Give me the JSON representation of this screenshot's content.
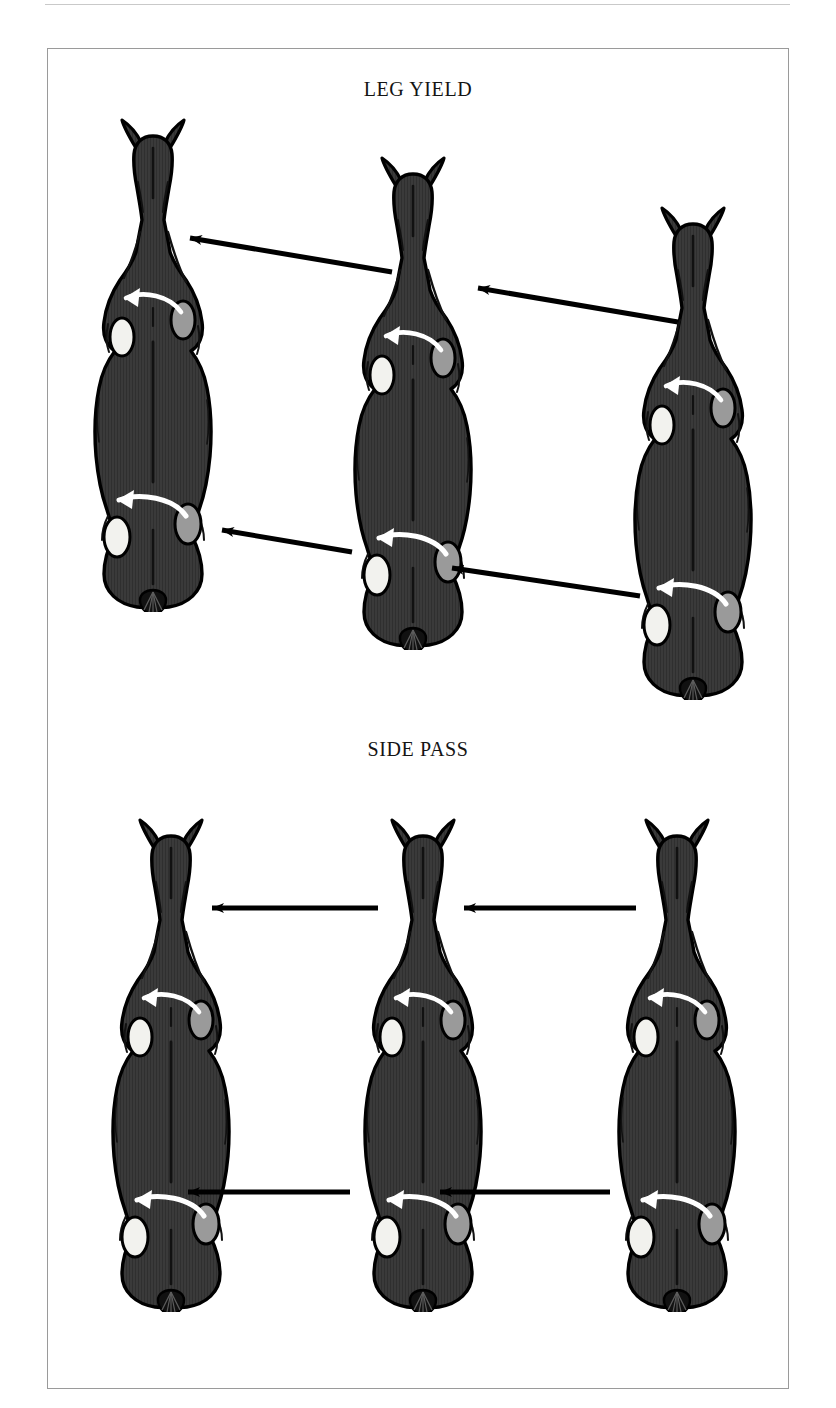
{
  "page": {
    "width": 836,
    "height": 1408,
    "background": "#ffffff",
    "frame_border_color": "#9a9a9a",
    "top_rule_color": "#c9c9c9"
  },
  "colors": {
    "body_fill": "#3a3a3a",
    "body_outline": "#000000",
    "texture_line": "#2b2b2b",
    "hoof_left": "#f2f2ee",
    "hoof_right": "#9a9a9a",
    "hoof_outline": "#000000",
    "motion_arrow": "#ffffff",
    "direction_arrow": "#000000",
    "title_text": "#141414"
  },
  "sections": [
    {
      "id": "leg-yield",
      "title": "LEG YIELD",
      "title_top": 78,
      "arrow_style": "diagonal",
      "horses": [
        {
          "name": "leg-yield-horse-1",
          "position": "left",
          "x": 78,
          "y": 112
        },
        {
          "name": "leg-yield-horse-2",
          "position": "center",
          "x": 338,
          "y": 150
        },
        {
          "name": "leg-yield-horse-3",
          "position": "right",
          "x": 618,
          "y": 200
        }
      ],
      "direction_arrows": [
        {
          "name": "shoulder-arrow-left",
          "x1": 392,
          "y1": 272,
          "x2": 190,
          "y2": 238
        },
        {
          "name": "shoulder-arrow-right",
          "x1": 678,
          "y1": 322,
          "x2": 478,
          "y2": 288
        },
        {
          "name": "hind-arrow-left",
          "x1": 352,
          "y1": 552,
          "x2": 222,
          "y2": 530
        },
        {
          "name": "hind-arrow-right",
          "x1": 640,
          "y1": 596,
          "x2": 452,
          "y2": 568
        }
      ]
    },
    {
      "id": "side-pass",
      "title": "SIDE PASS",
      "title_top": 738,
      "arrow_style": "horizontal",
      "horses": [
        {
          "name": "side-pass-horse-1",
          "position": "left",
          "x": 96,
          "y": 812
        },
        {
          "name": "side-pass-horse-2",
          "position": "center",
          "x": 348,
          "y": 812
        },
        {
          "name": "side-pass-horse-3",
          "position": "right",
          "x": 602,
          "y": 812
        }
      ],
      "direction_arrows": [
        {
          "name": "shoulder-arrow-left",
          "x1": 378,
          "y1": 908,
          "x2": 212,
          "y2": 908
        },
        {
          "name": "shoulder-arrow-right",
          "x1": 636,
          "y1": 908,
          "x2": 464,
          "y2": 908
        },
        {
          "name": "hind-arrow-left",
          "x1": 350,
          "y1": 1192,
          "x2": 188,
          "y2": 1192
        },
        {
          "name": "hind-arrow-right",
          "x1": 610,
          "y1": 1192,
          "x2": 440,
          "y2": 1192
        }
      ]
    }
  ],
  "horse_figure": {
    "view": "top-down",
    "width": 150,
    "height": 500,
    "parts": [
      "ear-left",
      "ear-right",
      "head",
      "neck",
      "shoulders",
      "barrel",
      "hindquarters",
      "rump",
      "tail"
    ],
    "hooves": {
      "front_left": {
        "fill_key": "hoof_left"
      },
      "front_right": {
        "fill_key": "hoof_right"
      },
      "hind_left": {
        "fill_key": "hoof_left"
      },
      "hind_right": {
        "fill_key": "hoof_right"
      }
    },
    "motion_arrows": [
      {
        "name": "front-leg-crossing-arrow",
        "direction": "right-to-left"
      },
      {
        "name": "hind-leg-crossing-arrow",
        "direction": "right-to-left"
      }
    ]
  }
}
